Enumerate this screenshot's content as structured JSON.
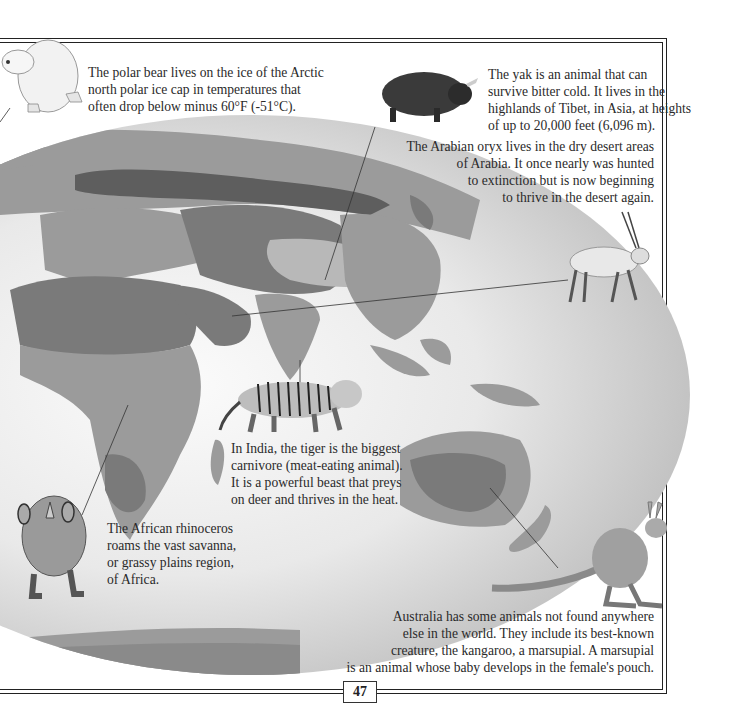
{
  "page": {
    "number": "47",
    "colors": {
      "ocean_light": "#f4f4f4",
      "ocean_dark": "#c9c9c9",
      "land_mid": "#9b9b9b",
      "land_dark": "#7a7a7a",
      "land_darkest": "#5e5e5e",
      "land_light": "#b8b8b8",
      "rule": "#222222"
    }
  },
  "captions": {
    "polar_bear": {
      "lines": [
        "The polar bear lives on the ice of the Arctic",
        "north polar ice cap in temperatures that",
        "often drop below minus 60°F (-51°C)."
      ]
    },
    "yak": {
      "lines": [
        "The yak is an animal that can",
        "survive bitter cold. It lives in the",
        "highlands of Tibet, in Asia, at heights",
        "of up to 20,000 feet (6,096 m)."
      ]
    },
    "oryx": {
      "lines": [
        "The Arabian oryx lives in the dry desert areas",
        "of Arabia. It once nearly was hunted",
        "to extinction but is now beginning",
        "to thrive in the desert again."
      ]
    },
    "tiger": {
      "lines": [
        "In India, the tiger is the biggest",
        "carnivore (meat-eating animal).",
        "It is a powerful beast that preys",
        "on deer and thrives in the heat."
      ]
    },
    "rhino": {
      "lines": [
        "The African rhinoceros",
        "roams the vast savanna,",
        "or grassy plains region,",
        "of Africa."
      ]
    },
    "kangaroo": {
      "lines": [
        "Australia has some animals not found anywhere",
        "else in the world. They include its best-known",
        "creature, the kangaroo, a marsupial. A marsupial",
        "is an animal whose baby develops in the female's pouch."
      ]
    }
  },
  "illustrations": [
    {
      "name": "polar-bear",
      "label": "Polar bear"
    },
    {
      "name": "yak",
      "label": "Yak"
    },
    {
      "name": "arabian-oryx",
      "label": "Arabian oryx"
    },
    {
      "name": "tiger",
      "label": "Tiger"
    },
    {
      "name": "african-rhinoceros",
      "label": "African rhinoceros"
    },
    {
      "name": "kangaroo",
      "label": "Kangaroo"
    }
  ]
}
